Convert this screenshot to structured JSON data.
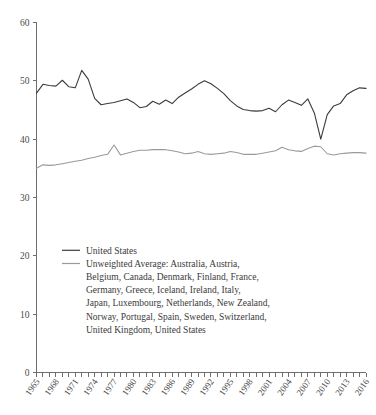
{
  "chart_data": {
    "type": "line",
    "title": "",
    "subtitle": "",
    "xlabel": "",
    "ylabel": "",
    "xlim": [
      1965,
      2016
    ],
    "ylim": [
      0,
      60
    ],
    "grid": false,
    "legend_position": "inside-lower-left",
    "ytick_labels": [
      "0",
      "10",
      "20",
      "30",
      "40",
      "50",
      "60"
    ],
    "ytick_values": [
      0,
      10,
      20,
      30,
      40,
      50,
      60
    ],
    "xtick_labels": [
      "1965",
      "1968",
      "1971",
      "1974",
      "1977",
      "1980",
      "1983",
      "1986",
      "1989",
      "1992",
      "1995",
      "1998",
      "2001",
      "2004",
      "2007",
      "2010",
      "2013",
      "2016"
    ],
    "xtick_values": [
      1965,
      1968,
      1971,
      1974,
      1977,
      1980,
      1983,
      1986,
      1989,
      1992,
      1995,
      1998,
      2001,
      2004,
      2007,
      2010,
      2013,
      2016
    ],
    "x": [
      1965,
      1966,
      1967,
      1968,
      1969,
      1970,
      1971,
      1972,
      1973,
      1974,
      1975,
      1976,
      1977,
      1978,
      1979,
      1980,
      1981,
      1982,
      1983,
      1984,
      1985,
      1986,
      1987,
      1988,
      1989,
      1990,
      1991,
      1992,
      1993,
      1994,
      1995,
      1996,
      1997,
      1998,
      1999,
      2000,
      2001,
      2002,
      2003,
      2004,
      2005,
      2006,
      2007,
      2008,
      2009,
      2010,
      2011,
      2012,
      2013,
      2014,
      2015,
      2016
    ],
    "series": [
      {
        "name": "United States",
        "color": "#3b3b3b",
        "values": [
          47.9,
          49.4,
          49.2,
          49.1,
          50.1,
          49.0,
          48.8,
          51.8,
          50.3,
          47.0,
          45.9,
          46.1,
          46.3,
          46.6,
          46.9,
          46.3,
          45.4,
          45.6,
          46.5,
          46.0,
          46.7,
          46.1,
          47.2,
          47.9,
          48.6,
          49.4,
          50.0,
          49.5,
          48.7,
          47.8,
          46.6,
          45.7,
          45.1,
          44.9,
          44.8,
          44.9,
          45.3,
          44.7,
          45.9,
          46.7,
          46.3,
          45.8,
          46.9,
          44.5,
          40.0,
          44.2,
          45.7,
          46.1,
          47.6,
          48.3,
          48.8,
          48.7
        ]
      },
      {
        "name": "Unweighted Average: Australia, Austria, Belgium, Canada, Denmark, Finland, France, Germany, Greece, Iceland, Ireland, Italy, Japan, Luxembourg, Netherlands, New Zealand, Norway, Portugal, Spain, Sweden, Switzerland, United Kingdom, United States",
        "color": "#9a9a9a",
        "values": [
          35.0,
          35.6,
          35.5,
          35.6,
          35.8,
          36.0,
          36.2,
          36.4,
          36.7,
          36.9,
          37.2,
          37.4,
          39.0,
          37.3,
          37.6,
          37.9,
          38.1,
          38.1,
          38.2,
          38.2,
          38.2,
          38.0,
          37.8,
          37.5,
          37.6,
          37.9,
          37.5,
          37.4,
          37.5,
          37.6,
          37.9,
          37.7,
          37.4,
          37.4,
          37.4,
          37.6,
          37.8,
          38.0,
          38.6,
          38.2,
          38.0,
          37.9,
          38.4,
          38.8,
          38.7,
          37.5,
          37.3,
          37.5,
          37.6,
          37.7,
          37.7,
          37.6
        ]
      }
    ]
  },
  "legend": {
    "entries": [
      {
        "label": "United States",
        "color": "#3b3b3b",
        "lines": [
          "United States"
        ]
      },
      {
        "label": "Unweighted Average",
        "color": "#9a9a9a",
        "lines": [
          "Unweighted Average: Australia, Austria,",
          "Belgium, Canada, Denmark, Finland, France,",
          "Germany, Greece, Iceland, Ireland, Italy,",
          "Japan, Luxembourg, Netherlands, New Zealand,",
          "Norway, Portugal, Spain, Sweden, Switzerland,",
          "United Kingdom, United States"
        ]
      }
    ]
  },
  "colors": {
    "axis": "#6e6e6e",
    "text": "#3c3c3c",
    "background": "#ffffff",
    "series_primary": "#3b3b3b",
    "series_secondary": "#9a9a9a"
  }
}
